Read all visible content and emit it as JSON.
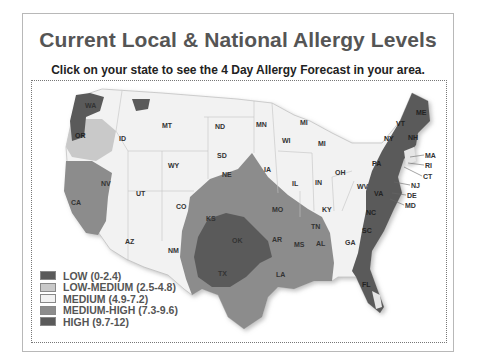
{
  "header": {
    "title": "Current Local & National Allergy Levels",
    "subtitle": "Click on your state to see the 4 Day Allergy Forecast in your area."
  },
  "legend": [
    {
      "label": "LOW (0-2.4)",
      "color": "#5a5a5a"
    },
    {
      "label": "LOW-MEDIUM (2.5-4.8)",
      "color": "#c9c9c9"
    },
    {
      "label": "MEDIUM (4.9-7.2)",
      "color": "#f2f2f2"
    },
    {
      "label": "MEDIUM-HIGH (7.3-9.6)",
      "color": "#8c8c8c"
    },
    {
      "label": "HIGH (9.7-12)",
      "color": "#5a5a5a"
    }
  ],
  "states": {
    "WA": "WA",
    "OR": "OR",
    "CA": "CA",
    "NV": "NV",
    "ID": "ID",
    "MT": "MT",
    "WY": "WY",
    "UT": "UT",
    "AZ": "AZ",
    "CO": "CO",
    "NM": "NM",
    "ND": "ND",
    "SD": "SD",
    "NE": "NE",
    "KS": "KS",
    "OK": "OK",
    "TX": "TX",
    "MN": "MN",
    "IA": "IA",
    "MO": "MO",
    "AR": "AR",
    "LA": "LA",
    "WI": "WI",
    "IL": "IL",
    "MI": "MI",
    "MI2": "MI",
    "IN": "IN",
    "OH": "OH",
    "KY": "KY",
    "TN": "TN",
    "MS": "MS",
    "AL": "AL",
    "GA": "GA",
    "FL": "FL",
    "WV": "WV",
    "VA": "VA",
    "NC": "NC",
    "SC": "SC",
    "PA": "PA",
    "NY": "NY",
    "VT": "VT",
    "NH": "NH",
    "ME": "ME",
    "MA": "MA",
    "RI": "RI",
    "CT": "CT",
    "NJ": "NJ",
    "DE": "DE",
    "MD": "MD"
  }
}
